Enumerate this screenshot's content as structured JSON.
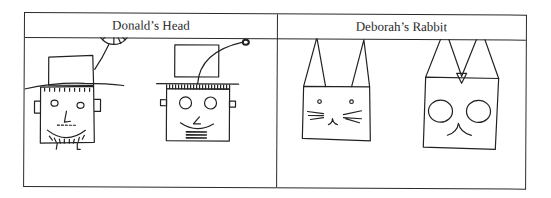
{
  "table": {
    "columns": [
      {
        "header": "Donald’s Head",
        "drawings": [
          "head-drawing-freehand",
          "head-drawing-ruled"
        ]
      },
      {
        "header": "Deborah’s Rabbit",
        "drawings": [
          "rabbit-drawing-freehand",
          "rabbit-drawing-geometric"
        ]
      }
    ]
  },
  "colors": {
    "ink": "#222222",
    "border": "#2a2a2a",
    "background": "#ffffff"
  }
}
